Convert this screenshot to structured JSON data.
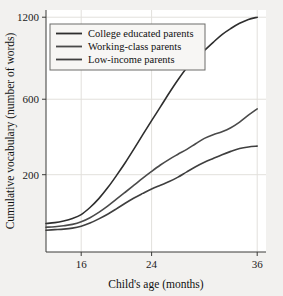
{
  "chart_data": {
    "type": "line",
    "title": "",
    "xlabel": "Child's age (months)",
    "ylabel": "Cumulative vocabulary (number of words)",
    "xlim": [
      12,
      37
    ],
    "ylim": [
      0,
      1260
    ],
    "xticks": [
      16,
      24,
      36
    ],
    "xticklabels": [
      "16",
      "24",
      "36"
    ],
    "yticks": [
      200,
      600,
      1200
    ],
    "yticklabels": [
      "200",
      "600",
      "1200"
    ],
    "grid": true,
    "legend_position": "upper-left",
    "x": [
      12,
      13,
      14,
      15,
      16,
      17,
      18,
      19,
      20,
      21,
      22,
      23,
      24,
      25,
      26,
      27,
      28,
      29,
      30,
      31,
      32,
      33,
      34,
      35,
      36
    ],
    "series": [
      {
        "name": "College educated parents",
        "label": "College educated parents",
        "color": "#2e2e2e",
        "values": [
          40,
          42,
          46,
          52,
          62,
          82,
          110,
          148,
          196,
          252,
          318,
          392,
          470,
          552,
          640,
          728,
          812,
          880,
          938,
          1000,
          1060,
          1108,
          1150,
          1182,
          1200
        ]
      },
      {
        "name": "Working-class parents",
        "label": "Working-class parents",
        "color": "#4a4a4a",
        "values": [
          32,
          33,
          35,
          38,
          44,
          54,
          68,
          86,
          108,
          132,
          158,
          186,
          214,
          242,
          268,
          292,
          316,
          344,
          372,
          392,
          408,
          430,
          462,
          502,
          540
        ]
      },
      {
        "name": "Low-income parents",
        "label": "Low-income parents",
        "color": "#3f3f3f",
        "values": [
          26,
          27,
          28,
          30,
          34,
          41,
          51,
          63,
          78,
          95,
          112,
          128,
          144,
          158,
          172,
          190,
          212,
          234,
          254,
          272,
          290,
          306,
          320,
          328,
          332
        ]
      }
    ]
  },
  "figure": {
    "background_color": "#f2f1ef",
    "plot_background_color": "#ffffff",
    "axis_color": "#3a3a38",
    "grid_color": "#e2e0dc"
  }
}
